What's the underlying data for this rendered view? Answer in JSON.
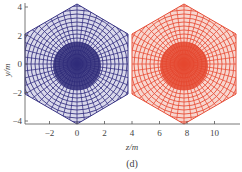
{
  "chart_data": {
    "type": "line",
    "title": "",
    "caption": "(d)",
    "xlabel": "z/m",
    "ylabel": "y/m",
    "xlim": [
      -3.8,
      11.8
    ],
    "ylim": [
      -4.4,
      4.4
    ],
    "xticks": [
      -2,
      0,
      2,
      4,
      6,
      8,
      10
    ],
    "yticks": [
      -4,
      -2,
      0,
      2,
      4
    ],
    "grid": false,
    "legend": null,
    "series": [
      {
        "name": "left mesh structure",
        "color": "#3a3585",
        "center": [
          0,
          0
        ],
        "outline": [
          [
            0,
            4.2
          ],
          [
            3.7,
            2.1
          ],
          [
            3.7,
            -2.1
          ],
          [
            0,
            -4.2
          ],
          [
            -3.8,
            -2.1
          ],
          [
            -3.8,
            2.1
          ]
        ],
        "description": "dense hexagonal wireframe mesh centered at z=0, y=0"
      },
      {
        "name": "right mesh structure",
        "color": "#e8503a",
        "center": [
          7.8,
          0
        ],
        "outline": [
          [
            7.8,
            4.2
          ],
          [
            11.6,
            2.1
          ],
          [
            11.6,
            -2.1
          ],
          [
            7.8,
            -4.2
          ],
          [
            4.0,
            -2.1
          ],
          [
            4.0,
            2.1
          ]
        ],
        "description": "dense hexagonal wireframe mesh centered at z=7.8, y=0"
      }
    ]
  }
}
